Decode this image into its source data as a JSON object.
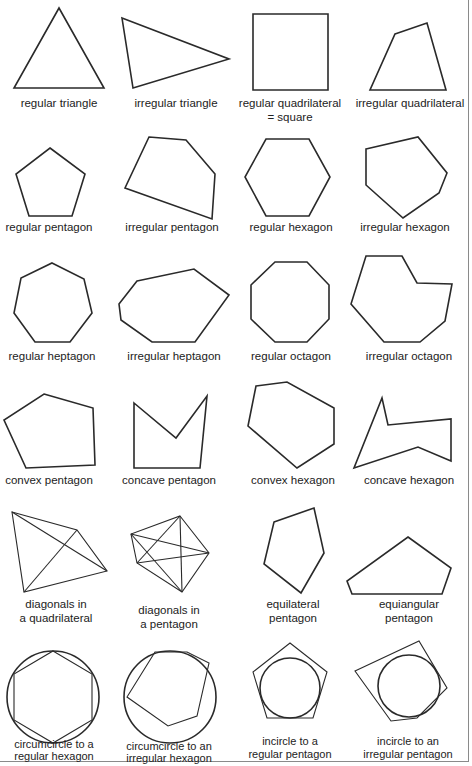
{
  "figure": {
    "cells": [
      {
        "id": "regular-triangle",
        "label": "regular triangle"
      },
      {
        "id": "irregular-triangle",
        "label": "irregular triangle"
      },
      {
        "id": "regular-quadrilateral",
        "label": "regular quadrilateral\n= square"
      },
      {
        "id": "irregular-quadrilateral",
        "label": "irregular quadrilateral"
      },
      {
        "id": "regular-pentagon",
        "label": "regular pentagon"
      },
      {
        "id": "irregular-pentagon",
        "label": "irregular pentagon"
      },
      {
        "id": "regular-hexagon",
        "label": "regular hexagon"
      },
      {
        "id": "irregular-hexagon",
        "label": "irregular hexagon"
      },
      {
        "id": "regular-heptagon",
        "label": "regular heptagon"
      },
      {
        "id": "irregular-heptagon",
        "label": "irregular heptagon"
      },
      {
        "id": "regular-octagon",
        "label": "regular octagon"
      },
      {
        "id": "irregular-octagon",
        "label": "irregular octagon"
      },
      {
        "id": "convex-pentagon",
        "label": "convex pentagon"
      },
      {
        "id": "concave-pentagon",
        "label": "concave pentagon"
      },
      {
        "id": "convex-hexagon",
        "label": "convex hexagon"
      },
      {
        "id": "concave-hexagon",
        "label": "concave hexagon"
      },
      {
        "id": "diagonals-quadrilateral",
        "label": "diagonals in\na quadrilateral"
      },
      {
        "id": "diagonals-pentagon",
        "label": "diagonals in\na pentagon"
      },
      {
        "id": "equilateral-pentagon",
        "label": "equilateral\npentagon"
      },
      {
        "id": "equiangular-pentagon",
        "label": "equiangular\npentagon"
      },
      {
        "id": "circumcircle-regular-hexagon",
        "label": "circumcircle to a\nregular hexagon"
      },
      {
        "id": "circumcircle-irregular-hexagon",
        "label": "circumcircle to an\nirregular hexagon"
      },
      {
        "id": "incircle-regular-pentagon",
        "label": "incircle to a\nregular pentagon"
      },
      {
        "id": "incircle-irregular-pentagon",
        "label": "incircle to an\nirregular pentagon"
      }
    ]
  }
}
